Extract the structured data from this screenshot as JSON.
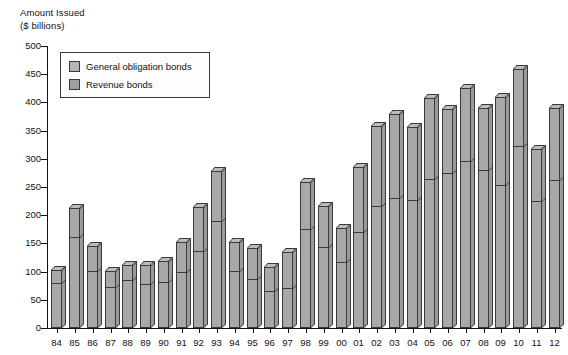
{
  "figure": {
    "axis_title_line1": "Amount Issued",
    "axis_title_line2": "($ billions)"
  },
  "legend": {
    "position": "top-left-inside",
    "items": [
      {
        "label": "General obligation bonds",
        "color": "#b4b4b4",
        "key": "general_obligation"
      },
      {
        "label": "Revenue bonds",
        "color": "#a0a0a0",
        "key": "revenue"
      }
    ]
  },
  "colors": {
    "bar_front": "#a8a8a8",
    "bar_top": "#bcbcbc",
    "bar_side": "#9a9a9a",
    "outline": "#3a3a3a",
    "axis": "#111111",
    "background": "#ffffff"
  },
  "chart_data": {
    "type": "bar",
    "title": "",
    "subtitle": "",
    "xlabel": "",
    "ylabel": "Amount Issued ($ billions)",
    "stacked": true,
    "grid": false,
    "ylim": [
      0,
      500
    ],
    "ytick_step": 50,
    "yticks": [
      0,
      50,
      100,
      150,
      200,
      250,
      300,
      350,
      400,
      450,
      500
    ],
    "ytick_labels": [
      "0",
      "50",
      "100",
      "150",
      "200",
      "250",
      "300",
      "350",
      "400",
      "450",
      "500"
    ],
    "categories": [
      "84",
      "85",
      "86",
      "87",
      "88",
      "89",
      "90",
      "91",
      "92",
      "93",
      "94",
      "95",
      "96",
      "97",
      "98",
      "99",
      "00",
      "01",
      "02",
      "03",
      "04",
      "05",
      "06",
      "07",
      "08",
      "09",
      "10",
      "11",
      "12"
    ],
    "series": [
      {
        "name": "Revenue bonds",
        "values": [
          78,
          160,
          100,
          71,
          83,
          77,
          80,
          97,
          135,
          188,
          99,
          85,
          63,
          69,
          174,
          142,
          115,
          169,
          214,
          229,
          226,
          262,
          273,
          295,
          279,
          252,
          321,
          224,
          261
        ]
      },
      {
        "name": "General obligation bonds",
        "values": [
          25,
          53,
          46,
          30,
          29,
          35,
          39,
          55,
          79,
          90,
          53,
          57,
          46,
          65,
          85,
          74,
          63,
          117,
          144,
          150,
          130,
          146,
          115,
          130,
          111,
          158,
          138,
          94,
          129
        ]
      }
    ],
    "totals": [
      103,
      213,
      146,
      101,
      112,
      112,
      119,
      152,
      214,
      278,
      152,
      142,
      109,
      134,
      259,
      216,
      178,
      286,
      358,
      379,
      356,
      408,
      388,
      425,
      390,
      410,
      459,
      318,
      390
    ]
  }
}
